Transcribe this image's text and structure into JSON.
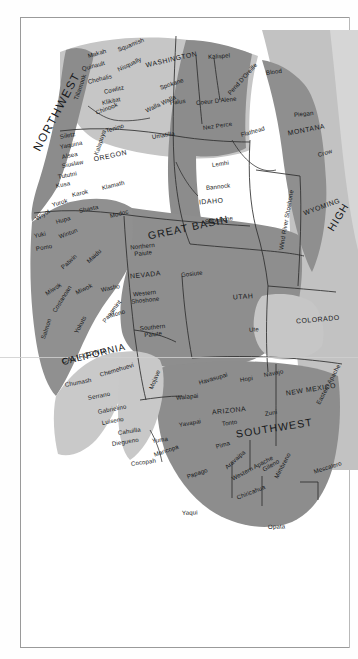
{
  "page": {
    "kind": "scanned-book-page",
    "figure_type": "map",
    "background_color": "#ffffff",
    "border_color": "#9a9a9a"
  },
  "map": {
    "colors": {
      "land_dark": "#8d8d8d",
      "land_mid": "#a8a8a8",
      "land_light": "#c4c4c4",
      "land_pale": "#d9d9d9",
      "ocean": "#ffffff",
      "boundary_line": "#3a3a3a",
      "label_text": "#16181a"
    },
    "culture_areas": [
      {
        "name": "NORTHWEST",
        "style": "big-nw",
        "x": 36,
        "y": 150,
        "rotate": -62
      },
      {
        "name": "GREAT BASIN",
        "style": "area",
        "x": 148,
        "y": 236,
        "rotate": -12
      },
      {
        "name": "CALIFORNIA",
        "style": "area-sm",
        "x": 62,
        "y": 362,
        "rotate": -14
      },
      {
        "name": "SOUTHWEST",
        "style": "area",
        "x": 236,
        "y": 434,
        "rotate": -9
      },
      {
        "name": "HIGH",
        "style": "area",
        "x": 330,
        "y": 230,
        "rotate": -58
      }
    ],
    "states": [
      {
        "name": "WASHINGTON",
        "x": 146,
        "y": 66,
        "rotate": -13
      },
      {
        "name": "OREGON",
        "x": 94,
        "y": 160,
        "rotate": -12
      },
      {
        "name": "MONTANA",
        "x": 288,
        "y": 134,
        "rotate": -11
      },
      {
        "name": "IDAHO",
        "x": 199,
        "y": 203,
        "rotate": -5
      },
      {
        "name": "WYOMING",
        "x": 304,
        "y": 214,
        "rotate": -20
      },
      {
        "name": "NEVADA",
        "x": 130,
        "y": 277,
        "rotate": -6
      },
      {
        "name": "UTAH",
        "x": 233,
        "y": 298,
        "rotate": -4
      },
      {
        "name": "COLORADO",
        "x": 296,
        "y": 322,
        "rotate": -5
      },
      {
        "name": "CALIFORNIA",
        "x": 62,
        "y": 362,
        "rotate": -14
      },
      {
        "name": "ARIZONA",
        "x": 212,
        "y": 413,
        "rotate": -6
      },
      {
        "name": "NEW MEXICO",
        "x": 286,
        "y": 394,
        "rotate": -9
      }
    ],
    "tribes": [
      {
        "name": "Makah",
        "x": 88,
        "y": 56,
        "rotate": -16
      },
      {
        "name": "Squamish",
        "x": 118,
        "y": 50,
        "rotate": -22
      },
      {
        "name": "Quinault",
        "x": 82,
        "y": 69,
        "rotate": -15
      },
      {
        "name": "Nisqually",
        "x": 118,
        "y": 70,
        "rotate": -26
      },
      {
        "name": "Chehalis",
        "x": 88,
        "y": 82,
        "rotate": -14
      },
      {
        "name": "Cowlitz",
        "x": 104,
        "y": 92,
        "rotate": -13
      },
      {
        "name": "Klikitat",
        "x": 102,
        "y": 103,
        "rotate": -12
      },
      {
        "name": "Tillamook",
        "x": 76,
        "y": 100,
        "rotate": -72
      },
      {
        "name": "Chinook",
        "x": 96,
        "y": 113,
        "rotate": -22
      },
      {
        "name": "Tenino",
        "x": 106,
        "y": 131,
        "rotate": -17
      },
      {
        "name": "Spokane",
        "x": 160,
        "y": 88,
        "rotate": -19
      },
      {
        "name": "Palus",
        "x": 170,
        "y": 103,
        "rotate": -8
      },
      {
        "name": "Walla Walla",
        "x": 146,
        "y": 111,
        "rotate": -26
      },
      {
        "name": "Umatilla",
        "x": 152,
        "y": 137,
        "rotate": -9
      },
      {
        "name": "Kalispel",
        "x": 208,
        "y": 57,
        "rotate": -4
      },
      {
        "name": "Coeur D'Alene",
        "x": 196,
        "y": 103,
        "rotate": -6
      },
      {
        "name": "Pend D'Oreille",
        "x": 229,
        "y": 94,
        "rotate": -48
      },
      {
        "name": "Nez Perce",
        "x": 203,
        "y": 128,
        "rotate": -8
      },
      {
        "name": "Flathead",
        "x": 241,
        "y": 135,
        "rotate": -16
      },
      {
        "name": "Blood",
        "x": 266,
        "y": 73,
        "rotate": -8
      },
      {
        "name": "Piegan",
        "x": 294,
        "y": 115,
        "rotate": -6
      },
      {
        "name": "Crow",
        "x": 318,
        "y": 155,
        "rotate": -16
      },
      {
        "name": "Lemhi",
        "x": 212,
        "y": 165,
        "rotate": -8
      },
      {
        "name": "Bannock",
        "x": 206,
        "y": 188,
        "rotate": -6
      },
      {
        "name": "Shoshone",
        "x": 205,
        "y": 222,
        "rotate": -8
      },
      {
        "name": "Wind River Shoshone",
        "x": 281,
        "y": 250,
        "rotate": -80
      },
      {
        "name": "Siletz",
        "x": 60,
        "y": 137,
        "rotate": -11
      },
      {
        "name": "Yaquina",
        "x": 60,
        "y": 147,
        "rotate": -11
      },
      {
        "name": "Alsea",
        "x": 62,
        "y": 157,
        "rotate": -11
      },
      {
        "name": "Siuslaw",
        "x": 62,
        "y": 166,
        "rotate": -11
      },
      {
        "name": "Tututni",
        "x": 58,
        "y": 177,
        "rotate": -11
      },
      {
        "name": "Kusa",
        "x": 56,
        "y": 186,
        "rotate": -11
      },
      {
        "name": "Kalapuya",
        "x": 96,
        "y": 155,
        "rotate": -72
      },
      {
        "name": "Klamath",
        "x": 102,
        "y": 188,
        "rotate": -14
      },
      {
        "name": "Karok",
        "x": 72,
        "y": 195,
        "rotate": -13
      },
      {
        "name": "Yurok",
        "x": 52,
        "y": 205,
        "rotate": -16
      },
      {
        "name": "Shasta",
        "x": 79,
        "y": 211,
        "rotate": -12
      },
      {
        "name": "Modoc",
        "x": 110,
        "y": 216,
        "rotate": -14
      },
      {
        "name": "Wiyot",
        "x": 36,
        "y": 219,
        "rotate": -32
      },
      {
        "name": "Hupa",
        "x": 56,
        "y": 222,
        "rotate": -16
      },
      {
        "name": "Yuki",
        "x": 34,
        "y": 236,
        "rotate": -12
      },
      {
        "name": "Wintun",
        "x": 59,
        "y": 237,
        "rotate": -21
      },
      {
        "name": "Pomo",
        "x": 36,
        "y": 249,
        "rotate": -11
      },
      {
        "name": "Patwin",
        "x": 62,
        "y": 268,
        "rotate": -42
      },
      {
        "name": "Maidu",
        "x": 88,
        "y": 262,
        "rotate": -44
      },
      {
        "name": "Miwok",
        "x": 46,
        "y": 294,
        "rotate": -33
      },
      {
        "name": "Miwok",
        "x": 76,
        "y": 293,
        "rotate": -26
      },
      {
        "name": "Costanoan",
        "x": 54,
        "y": 312,
        "rotate": -58
      },
      {
        "name": "Salmon",
        "x": 43,
        "y": 339,
        "rotate": -72
      },
      {
        "name": "Yokuts",
        "x": 76,
        "y": 333,
        "rotate": -62
      },
      {
        "name": "Panamint",
        "x": 104,
        "y": 322,
        "rotate": -53
      },
      {
        "name": "Washo",
        "x": 101,
        "y": 290,
        "rotate": -12
      },
      {
        "name": "Mono",
        "x": 110,
        "y": 316,
        "rotate": -17
      },
      {
        "name": "Northern Paiute",
        "x": 122,
        "y": 252,
        "rotate": -6,
        "two_line": true
      },
      {
        "name": "Western Shoshone",
        "x": 124,
        "y": 299,
        "rotate": -6,
        "two_line": true
      },
      {
        "name": "Southern Paiute",
        "x": 132,
        "y": 333,
        "rotate": -6,
        "two_line": true
      },
      {
        "name": "Gosiute",
        "x": 181,
        "y": 275,
        "rotate": -6
      },
      {
        "name": "Ute",
        "x": 249,
        "y": 330,
        "rotate": -5
      },
      {
        "name": "Chemehuevi",
        "x": 100,
        "y": 375,
        "rotate": -17
      },
      {
        "name": "Chumash",
        "x": 65,
        "y": 385,
        "rotate": -11
      },
      {
        "name": "Serrano",
        "x": 88,
        "y": 398,
        "rotate": -11
      },
      {
        "name": "Gabrielino",
        "x": 98,
        "y": 412,
        "rotate": -11
      },
      {
        "name": "Luiseno",
        "x": 102,
        "y": 423,
        "rotate": -11
      },
      {
        "name": "Cahuilla",
        "x": 118,
        "y": 433,
        "rotate": -9
      },
      {
        "name": "Diegueno",
        "x": 112,
        "y": 444,
        "rotate": -9
      },
      {
        "name": "Yuma",
        "x": 152,
        "y": 441,
        "rotate": -8
      },
      {
        "name": "Cocopah",
        "x": 131,
        "y": 464,
        "rotate": -8
      },
      {
        "name": "Mojave",
        "x": 151,
        "y": 389,
        "rotate": -68
      },
      {
        "name": "Walapai",
        "x": 176,
        "y": 398,
        "rotate": -6
      },
      {
        "name": "Havasupai",
        "x": 199,
        "y": 383,
        "rotate": -17
      },
      {
        "name": "Hopi",
        "x": 240,
        "y": 380,
        "rotate": -9
      },
      {
        "name": "Navajo",
        "x": 264,
        "y": 375,
        "rotate": -11
      },
      {
        "name": "Zuni",
        "x": 265,
        "y": 414,
        "rotate": -10
      },
      {
        "name": "Yavapai",
        "x": 179,
        "y": 425,
        "rotate": -10
      },
      {
        "name": "Tonto",
        "x": 222,
        "y": 424,
        "rotate": -8
      },
      {
        "name": "Maricopa",
        "x": 154,
        "y": 455,
        "rotate": -19
      },
      {
        "name": "Pima",
        "x": 216,
        "y": 447,
        "rotate": -17
      },
      {
        "name": "Papago",
        "x": 187,
        "y": 477,
        "rotate": -19
      },
      {
        "name": "Aravaipa",
        "x": 226,
        "y": 468,
        "rotate": -42
      },
      {
        "name": "Western Apache",
        "x": 232,
        "y": 479,
        "rotate": -28
      },
      {
        "name": "Gileno",
        "x": 263,
        "y": 470,
        "rotate": -30
      },
      {
        "name": "Chiricahua",
        "x": 237,
        "y": 498,
        "rotate": -22
      },
      {
        "name": "Mimbreno",
        "x": 276,
        "y": 478,
        "rotate": -62
      },
      {
        "name": "Eastern Apache",
        "x": 318,
        "y": 404,
        "rotate": -62
      },
      {
        "name": "Mescalero",
        "x": 314,
        "y": 472,
        "rotate": -18
      },
      {
        "name": "Yaqui",
        "x": 182,
        "y": 513,
        "rotate": -2
      },
      {
        "name": "Opata",
        "x": 268,
        "y": 527,
        "rotate": -2
      }
    ]
  }
}
